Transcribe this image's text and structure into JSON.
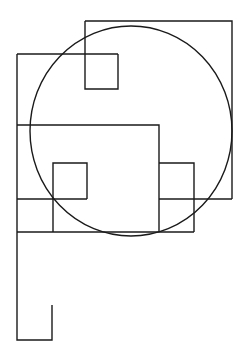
{
  "figure": {
    "width": 248,
    "height": 360,
    "background": "#ffffff",
    "stroke_color": "#1a1a1a",
    "circle": {
      "cx": 131,
      "cy": 131,
      "rx": 101,
      "ry": 105
    },
    "paths": [
      {
        "name": "top-right-large-square",
        "d": "M85 21 L232 21 L232 199"
      },
      {
        "name": "top-small-square",
        "d": "M85 21 L85 89 L118 89 L118 54"
      },
      {
        "name": "upper-left-rectangle-top",
        "d": "M17 54 L118 54"
      },
      {
        "name": "left-long-edge",
        "d": "M17 54 L17 340 L52 340 L52 305"
      },
      {
        "name": "middle-horizontal-line",
        "d": "M17 125 L159 125 L159 232"
      },
      {
        "name": "inner-small-square",
        "d": "M53 232 L53 163 L87 163 L87 199"
      },
      {
        "name": "left-mid-horizontal",
        "d": "M17 199 L87 199"
      },
      {
        "name": "bottom-horizontal-line",
        "d": "M17 232 L194 232"
      },
      {
        "name": "right-small-rectangle",
        "d": "M159 163 L194 163 L194 232"
      },
      {
        "name": "right-mid-horizontal",
        "d": "M159 199 L232 199"
      }
    ]
  }
}
